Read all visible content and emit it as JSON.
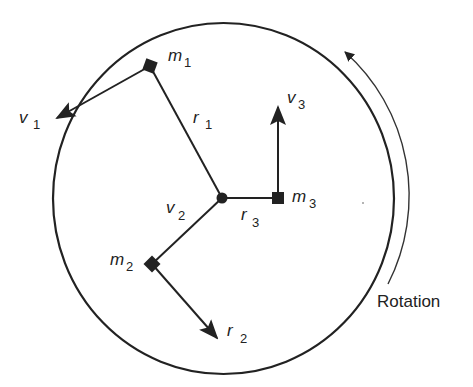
{
  "diagram": {
    "type": "rotating-disc-mass-diagram",
    "colors": {
      "stroke": "#222222",
      "background": "#ffffff"
    },
    "masses": [
      {
        "id": "m1",
        "label": "m",
        "sub": "1"
      },
      {
        "id": "m2",
        "label": "m",
        "sub": "2"
      },
      {
        "id": "m3",
        "label": "m",
        "sub": "3"
      }
    ],
    "radii": [
      {
        "id": "r1",
        "label": "r",
        "sub": "1"
      },
      {
        "id": "r2",
        "label": "r",
        "sub": "2"
      },
      {
        "id": "r3",
        "label": "r",
        "sub": "3"
      }
    ],
    "velocities": [
      {
        "id": "v1",
        "label": "v",
        "sub": "1"
      },
      {
        "id": "v2",
        "label": "v",
        "sub": "2"
      },
      {
        "id": "v3",
        "label": "v",
        "sub": "3"
      }
    ],
    "rotation_label": "Rotation"
  }
}
